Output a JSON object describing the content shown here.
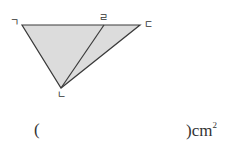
{
  "figure": {
    "vertices": {
      "g": {
        "label": "ㄱ",
        "x": 22,
        "y": 25
      },
      "r": {
        "label": "ㄹ",
        "x": 104,
        "y": 25
      },
      "d": {
        "label": "ㄷ",
        "x": 140,
        "y": 25
      },
      "n": {
        "label": "ㄴ",
        "x": 61,
        "y": 88
      }
    },
    "fill_color": "#dcdcdc",
    "stroke_color": "#3a3a3a"
  },
  "answer": {
    "open_paren": "(",
    "close_paren": ")",
    "unit": "cm",
    "unit_exponent": "2"
  }
}
